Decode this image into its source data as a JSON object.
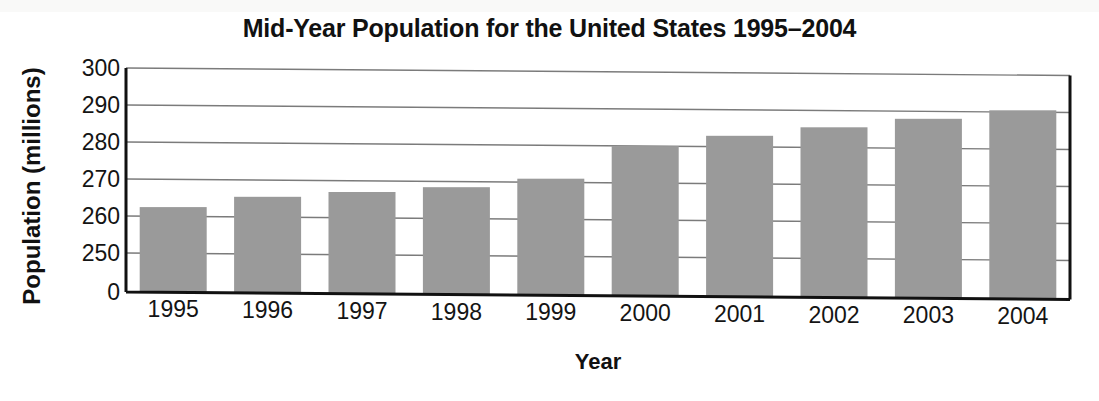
{
  "chart_data": {
    "type": "bar",
    "title": "Mid-Year Population for the United States 1995–2004",
    "xlabel": "Year",
    "ylabel": "Population (millions)",
    "categories": [
      "1995",
      "1996",
      "1997",
      "1998",
      "1999",
      "2000",
      "2001",
      "2002",
      "2003",
      "2004"
    ],
    "values": [
      262.5,
      265.5,
      267.0,
      268.5,
      271.0,
      280.0,
      283.0,
      285.5,
      288.0,
      290.5
    ],
    "ylim": [
      250,
      300
    ],
    "y_ticks": [
      "300",
      "290",
      "280",
      "270",
      "260",
      "250",
      "0"
    ],
    "y_tick_values": [
      300,
      290,
      280,
      270,
      260,
      250,
      0
    ],
    "axis_break": true,
    "axis_break_note": "y-axis is broken: jumps from 0 to 250",
    "grid": true,
    "legend": false,
    "bar_color": "#9a9a9a",
    "gridline_color": "#7b7b7b",
    "axis_color": "#111111",
    "background_color": "#ffffff"
  },
  "figure": {
    "title": "Mid-Year Population for the United States 1995–2004",
    "x_axis_title": "Year",
    "y_axis_title": "Population (millions)"
  }
}
